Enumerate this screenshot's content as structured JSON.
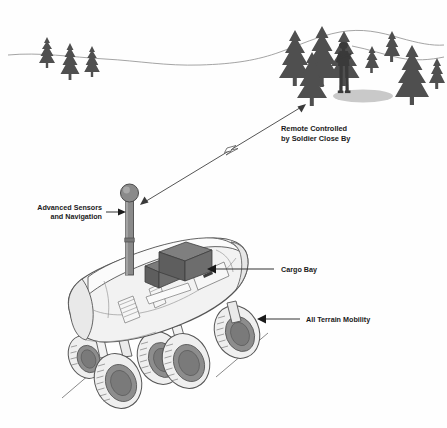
{
  "illustration": {
    "title": "Unmanned Ground Vehicle Concept Illustration",
    "background_color": "#fefefe",
    "line_color": "#4a4a4a",
    "tree_color": "#4f4f4f",
    "soldier_color": "#3a3a3a",
    "shadow_color": "#c9c9c9",
    "body_fill": "#f2f2f2",
    "body_stroke": "#555555",
    "mast_fill": "#8a8a8a",
    "cargo_fill": "#6e6e6e",
    "cargo_fill_dark": "#5a5a5a",
    "wheel_hub_fill": "#8d8d8d",
    "wheel_tread_fill": "#efefef",
    "horizon_color": "#9a9a9a"
  },
  "callouts": [
    {
      "id": "remote-control",
      "label_line_1": "Remote Controlled",
      "label_line_2": "by Soldier Close By",
      "arrow_type": "double-headed",
      "symbol": "lightning-bolt"
    },
    {
      "id": "advanced-sensors",
      "label_line_1": "Advanced Sensors",
      "label_line_2": "and Navigation",
      "arrow_type": "leader-arrow",
      "points_to": "sensor-mast"
    },
    {
      "id": "cargo-bay",
      "label_line_1": "Cargo Bay",
      "label_line_2": "",
      "arrow_type": "leader-arrow",
      "points_to": "cargo-boxes"
    },
    {
      "id": "all-terrain-mobility",
      "label_line_1": "All Terrain Mobility",
      "label_line_2": "",
      "arrow_type": "leader-arrow",
      "points_to": "wheels"
    }
  ],
  "scene_elements": {
    "left_tree_group_count": 3,
    "right_tree_group_count": 7,
    "soldier_count": 1,
    "vehicle_wheel_count": 6,
    "cargo_box_count": 2,
    "sensor_mast_count": 1,
    "ground_line_count": 2
  }
}
